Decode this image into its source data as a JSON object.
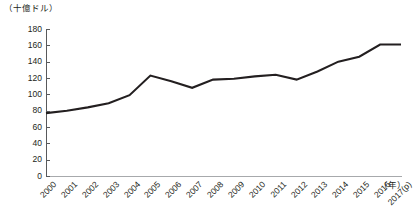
{
  "chart_data": {
    "type": "line",
    "title": "",
    "subtitle": "",
    "unit_caption": "（十億ドル）",
    "xlabel": "（年）",
    "ylabel": "",
    "ylim": [
      0,
      180
    ],
    "yticks": [
      180,
      160,
      140,
      120,
      100,
      80,
      60,
      40,
      20,
      0
    ],
    "grid": false,
    "legend": "none",
    "categories": [
      "2000",
      "2001",
      "2002",
      "2003",
      "2004",
      "2005",
      "2006",
      "2007",
      "2008",
      "2009",
      "2010",
      "2011",
      "2012",
      "2013",
      "2014",
      "2015",
      "2016",
      "2017(p)"
    ],
    "values": [
      77,
      80,
      84,
      89,
      99,
      123,
      116,
      108,
      118,
      119,
      122,
      124,
      118,
      128,
      140,
      146,
      161,
      161
    ],
    "series": [
      {
        "name": "",
        "color": "#231f20",
        "values": [
          77,
          80,
          84,
          89,
          99,
          123,
          116,
          108,
          118,
          119,
          122,
          124,
          118,
          128,
          140,
          146,
          161,
          161
        ]
      }
    ],
    "line_color": "#231f20",
    "axis_color": "#58595b",
    "text_color": "#231f20",
    "background": "#ffffff"
  }
}
